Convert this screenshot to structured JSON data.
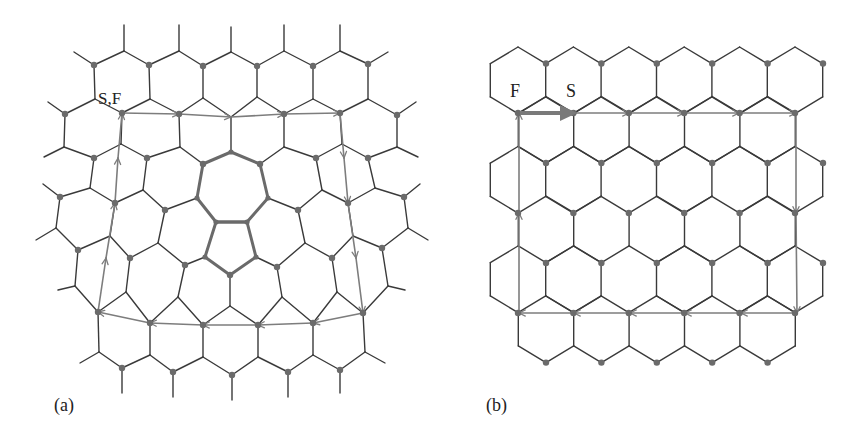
{
  "figure": {
    "panel_a": {
      "caption": "(a)",
      "label": "S,F",
      "description": "Distorted hexagonal lattice containing a pentagon-heptagon pair (dislocation) with a Burgers circuit drawn around it"
    },
    "panel_b": {
      "caption": "(b)",
      "label_start": "F",
      "label_end": "S",
      "description": "Perfect hexagonal lattice with the same closed circuit; the closure failure F to S is the Burgers vector"
    }
  },
  "colors": {
    "lattice": "#3a3a3a",
    "defect": "#6a6a6a",
    "circuit": "#7d7d7d",
    "node": "#6b6b6b",
    "burgers_arrow": "#7a7a7a"
  }
}
